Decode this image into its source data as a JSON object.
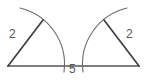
{
  "figure": {
    "type": "geometry-diagram",
    "width": 147,
    "height": 81,
    "background_color": "#ffffff",
    "stroke_color": "#555555",
    "label_color": "#555555",
    "labels": {
      "left_radius": "2",
      "right_radius": "2",
      "base_segment": "5"
    },
    "shapes": {
      "baseline": {
        "name": "baseline",
        "x1": 8,
        "y1": 66,
        "x2": 139,
        "y2": 66,
        "stroke_width": 1.6
      },
      "left_sector": {
        "name": "left-sector",
        "vertex": {
          "x": 8,
          "y": 66
        },
        "radius_endpoint": {
          "x": 43,
          "y": 20
        },
        "arc_start": {
          "x": 20,
          "y": 8
        },
        "arc_end": {
          "x": 64,
          "y": 72
        },
        "arc_radius": 58
      },
      "right_sector": {
        "name": "right-sector",
        "vertex": {
          "x": 139,
          "y": 66
        },
        "radius_endpoint": {
          "x": 104,
          "y": 20
        },
        "arc_start": {
          "x": 127,
          "y": 8
        },
        "arc_end": {
          "x": 83,
          "y": 72
        },
        "arc_radius": 58
      }
    }
  }
}
